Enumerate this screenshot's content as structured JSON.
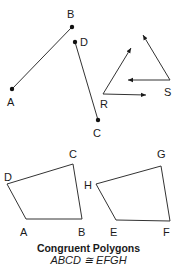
{
  "figure": {
    "segments": {
      "ab": {
        "start": "A",
        "end": "B"
      },
      "cd": {
        "start": "D",
        "end": "C"
      }
    },
    "rays": {
      "origin_R": "R",
      "origin_S": "S"
    },
    "quadrilaterals": {
      "first": [
        "A",
        "B",
        "C",
        "D"
      ],
      "second": [
        "E",
        "F",
        "G",
        "H"
      ]
    },
    "labels": {
      "A": "A",
      "B": "B",
      "C": "C",
      "D": "D",
      "R": "R",
      "S": "S",
      "qA": "A",
      "qB": "B",
      "qC": "C",
      "qD": "D",
      "qE": "E",
      "qF": "F",
      "qG": "G",
      "qH": "H"
    },
    "caption_title": "Congruent Polygons",
    "caption_statement": "ABCD ≅ EFGH"
  }
}
